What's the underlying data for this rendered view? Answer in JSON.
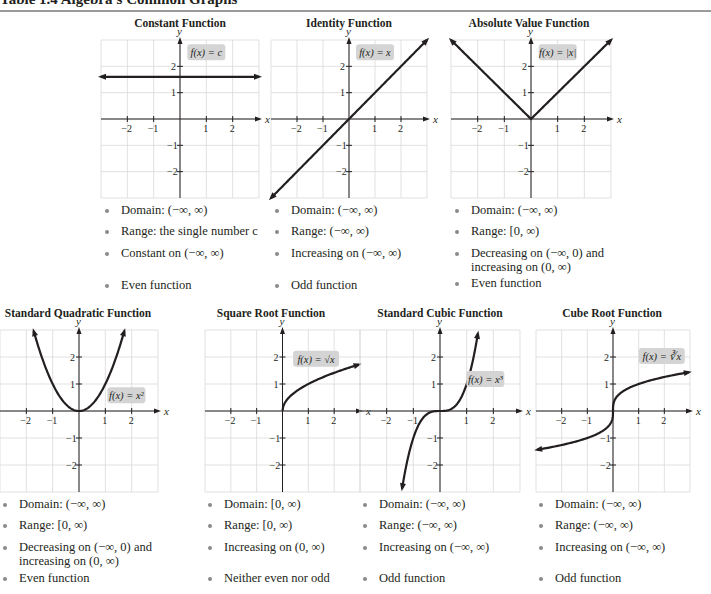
{
  "table_title": "Table 1.4   Algebra's Common Graphs",
  "colors": {
    "grid": "#d9d9d9",
    "axis": "#231f20",
    "curve": "#231f20",
    "label_box": "#d4d4d4",
    "bullet": "#8a8a8a"
  },
  "panels": [
    {
      "title": "Constant Function",
      "label": "f(x) = c",
      "bullets": [
        "Domain: (−∞, ∞)",
        "Range: the single number c",
        "Constant on (−∞, ∞)",
        "Even function"
      ]
    },
    {
      "title": "Identity Function",
      "label": "f(x) = x",
      "bullets": [
        "Domain: (−∞, ∞)",
        "Range: (−∞, ∞)",
        "Increasing on (−∞, ∞)",
        "Odd function"
      ]
    },
    {
      "title": "Absolute Value Function",
      "label": "f(x) = |x|",
      "bullets": [
        "Domain: (−∞, ∞)",
        "Range: [0, ∞)",
        "Decreasing on (−∞, 0) and",
        "increasing on (0, ∞)",
        "Even function"
      ]
    },
    {
      "title": "Standard Quadratic Function",
      "label": "f(x) = x²",
      "bullets": [
        "Domain: (−∞, ∞)",
        "Range: [0, ∞)",
        "Decreasing on (−∞, 0) and",
        "increasing on (0, ∞)",
        "Even function"
      ]
    },
    {
      "title": "Square Root Function",
      "label": "f(x) = √x",
      "bullets": [
        "Domain: [0, ∞)",
        "Range: [0, ∞)",
        "Increasing on (0, ∞)",
        "Neither even nor odd"
      ]
    },
    {
      "title": "Standard Cubic Function",
      "label": "f(x) = x³",
      "bullets": [
        "Domain: (−∞, ∞)",
        "Range: (−∞, ∞)",
        "Increasing on (−∞, ∞)",
        "Odd function"
      ]
    },
    {
      "title": "Cube Root Function",
      "label": "f(x) = ∛x",
      "bullets": [
        "Domain: (−∞, ∞)",
        "Range: (−∞, ∞)",
        "Increasing on (−∞, ∞)",
        "Odd function"
      ]
    }
  ],
  "axes": {
    "x_label": "x",
    "y_label": "y",
    "x_ticks": [
      "−2",
      "−1",
      "1",
      "2"
    ],
    "y_ticks": [
      "2",
      "1",
      "−1",
      "−2"
    ]
  },
  "chart_data": [
    {
      "type": "line",
      "title": "Constant Function",
      "function": "f(x) = c",
      "xlabel": "x",
      "ylabel": "y",
      "xlim": [
        -3,
        3
      ],
      "ylim": [
        -3,
        3
      ],
      "grid": true,
      "x": [
        -3,
        3
      ],
      "y": [
        1.6,
        1.6
      ]
    },
    {
      "type": "line",
      "title": "Identity Function",
      "function": "f(x) = x",
      "xlabel": "x",
      "ylabel": "y",
      "xlim": [
        -3,
        3
      ],
      "ylim": [
        -3,
        3
      ],
      "grid": true,
      "x": [
        -3,
        3
      ],
      "y": [
        -3,
        3
      ]
    },
    {
      "type": "line",
      "title": "Absolute Value Function",
      "function": "f(x) = |x|",
      "xlabel": "x",
      "ylabel": "y",
      "xlim": [
        -3,
        3
      ],
      "ylim": [
        -3,
        3
      ],
      "grid": true,
      "x": [
        -3,
        0,
        3
      ],
      "y": [
        3,
        0,
        3
      ]
    },
    {
      "type": "line",
      "title": "Standard Quadratic Function",
      "function": "f(x) = x^2",
      "xlabel": "x",
      "ylabel": "y",
      "xlim": [
        -3,
        3
      ],
      "ylim": [
        -3,
        3
      ],
      "grid": true,
      "x": [
        -1.7,
        -1,
        -0.5,
        0,
        0.5,
        1,
        1.7
      ],
      "y": [
        2.89,
        1,
        0.25,
        0,
        0.25,
        1,
        2.89
      ]
    },
    {
      "type": "line",
      "title": "Square Root Function",
      "function": "f(x) = sqrt(x)",
      "xlabel": "x",
      "ylabel": "y",
      "xlim": [
        -3,
        3
      ],
      "ylim": [
        -3,
        3
      ],
      "grid": true,
      "x": [
        0,
        0.25,
        1,
        2,
        2.9
      ],
      "y": [
        0,
        0.5,
        1,
        1.41,
        1.7
      ]
    },
    {
      "type": "line",
      "title": "Standard Cubic Function",
      "function": "f(x) = x^3",
      "xlabel": "x",
      "ylabel": "y",
      "xlim": [
        -3,
        3
      ],
      "ylim": [
        -3,
        3
      ],
      "grid": true,
      "x": [
        -1.42,
        -1,
        -0.5,
        0,
        0.5,
        1,
        1.42
      ],
      "y": [
        -2.86,
        -1,
        -0.125,
        0,
        0.125,
        1,
        2.86
      ]
    },
    {
      "type": "line",
      "title": "Cube Root Function",
      "function": "f(x) = cbrt(x)",
      "xlabel": "x",
      "ylabel": "y",
      "xlim": [
        -3,
        3
      ],
      "ylim": [
        -3,
        3
      ],
      "grid": true,
      "x": [
        -2.9,
        -1,
        -0.125,
        0,
        0.125,
        1,
        2.9
      ],
      "y": [
        -1.43,
        -1,
        -0.5,
        0,
        0.5,
        1,
        1.43
      ]
    }
  ]
}
